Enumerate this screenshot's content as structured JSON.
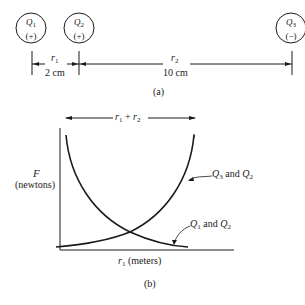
{
  "figure_a": {
    "caption": "(a)",
    "charges": [
      {
        "name": "Q",
        "sub": "1",
        "sign": "(+)"
      },
      {
        "name": "Q",
        "sub": "2",
        "sign": "(+)"
      },
      {
        "name": "Q",
        "sub": "3",
        "sign": "(−)"
      }
    ],
    "distances": [
      {
        "symbol": "r",
        "sub": "1",
        "value": "2 cm"
      },
      {
        "symbol": "r",
        "sub": "2",
        "value": "10 cm"
      }
    ]
  },
  "figure_b": {
    "caption": "(b)",
    "span_label": {
      "a": "r",
      "a_sub": "1",
      "plus": " + ",
      "b": "r",
      "b_sub": "2"
    },
    "y_label": {
      "symbol": "F",
      "unit": "(newtons)"
    },
    "x_label": {
      "symbol": "r",
      "sub": "1",
      "unit": " (meters)"
    },
    "curves": [
      {
        "label_q1": "Q",
        "label_q1_sub": "3",
        "label_and": " and ",
        "label_q2": "Q",
        "label_q2_sub": "2",
        "trend": "increasing"
      },
      {
        "label_q1": "Q",
        "label_q1_sub": "1",
        "label_and": " and ",
        "label_q2": "Q",
        "label_q2_sub": "2",
        "trend": "decreasing"
      }
    ]
  }
}
